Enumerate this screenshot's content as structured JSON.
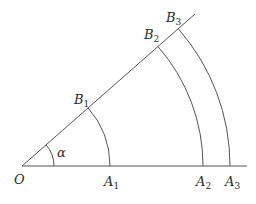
{
  "diagram": {
    "title": "",
    "vertex": {
      "name": "O",
      "x": 22,
      "y": 166
    },
    "angle": {
      "label": "α",
      "degrees": 41.3,
      "arc_radius": 32
    },
    "base_ray_end": {
      "x": 247,
      "y": 166
    },
    "slanted_ray_end": {
      "x": 195,
      "y": 14
    },
    "arcs": [
      {
        "radius": 88,
        "A": {
          "label": "A",
          "sub": "1"
        },
        "B": {
          "label": "B",
          "sub": "1"
        }
      },
      {
        "radius": 181,
        "A": {
          "label": "A",
          "sub": "2"
        },
        "B": {
          "label": "B",
          "sub": "2"
        }
      },
      {
        "radius": 208,
        "A": {
          "label": "A",
          "sub": "3"
        },
        "B": {
          "label": "B",
          "sub": "3"
        }
      }
    ],
    "colors": {
      "line": "#555555",
      "text": "#2a2a2a",
      "background": "#ffffff"
    }
  }
}
